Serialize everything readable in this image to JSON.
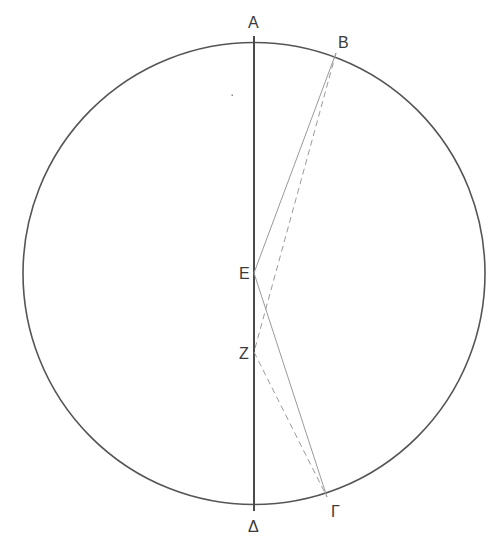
{
  "diagram": {
    "type": "geometric-construction",
    "points": {
      "A": {
        "label": "A",
        "role": "top end of diameter"
      },
      "B": {
        "label": "B",
        "role": "point on circle"
      },
      "E": {
        "label": "E",
        "role": "center on diameter"
      },
      "Z": {
        "label": "Z",
        "role": "point on diameter below E"
      },
      "Delta": {
        "label": "Δ",
        "role": "bottom end of diameter"
      },
      "Gamma": {
        "label": "Γ",
        "role": "point on circle"
      }
    },
    "segments": [
      {
        "from": "A",
        "to": "Delta",
        "style": "solid-thick"
      },
      {
        "from": "B",
        "to": "E",
        "style": "solid-thin"
      },
      {
        "from": "E",
        "to": "Gamma",
        "style": "solid-thin"
      },
      {
        "from": "B",
        "to": "Z",
        "style": "dashed"
      },
      {
        "from": "Z",
        "to": "Gamma",
        "style": "dashed"
      }
    ]
  }
}
